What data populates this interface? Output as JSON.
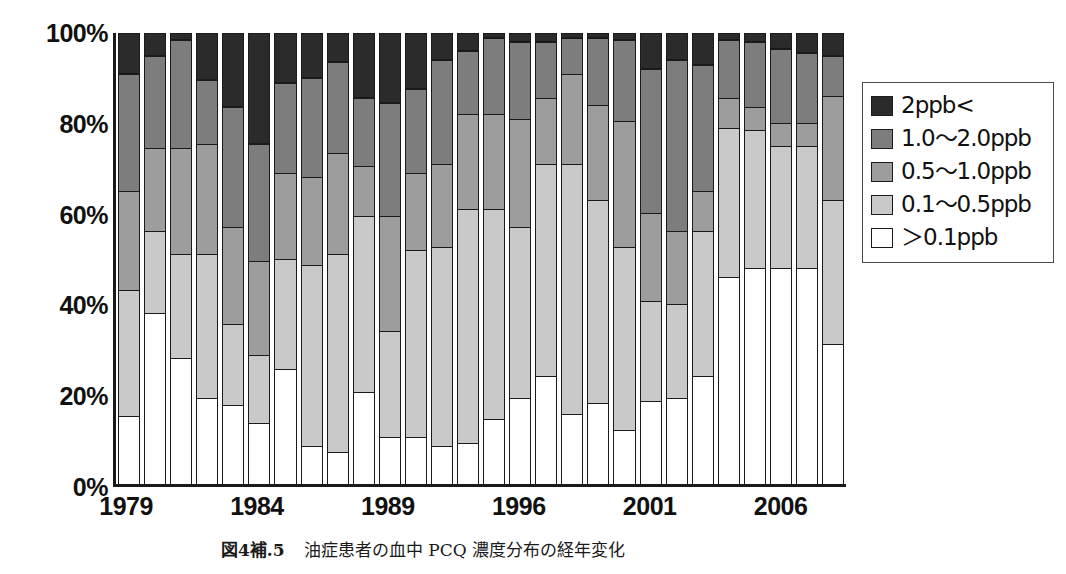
{
  "caption": {
    "figure_number": "図4補.5",
    "text": "油症患者の血中 PCQ 濃度分布の経年変化"
  },
  "legend": {
    "position": "right",
    "items": [
      {
        "label": "2ppb<",
        "color": "#2b2b2b",
        "key": "gt2"
      },
      {
        "label": "1.0〜2.0ppb",
        "color": "#7d7d7d",
        "key": "r1_2"
      },
      {
        "label": "0.5〜1.0ppb",
        "color": "#9d9d9d",
        "key": "r05_1"
      },
      {
        "label": "0.1〜0.5ppb",
        "color": "#c9c9c9",
        "key": "r01_05"
      },
      {
        "label": "＞0.1ppb",
        "color": "#ffffff",
        "key": "lt01"
      }
    ]
  },
  "chart_data": {
    "type": "bar",
    "stacked": true,
    "normalized_percent": true,
    "title": "",
    "xlabel": "",
    "ylabel": "",
    "ylim": [
      0,
      100
    ],
    "grid": false,
    "ytick_labels": [
      "0%",
      "20%",
      "40%",
      "60%",
      "80%",
      "100%"
    ],
    "ytick_values": [
      0,
      20,
      40,
      60,
      80,
      100
    ],
    "xtick_labels": [
      "1979",
      "1984",
      "1989",
      "1996",
      "2001",
      "2006"
    ],
    "xtick_bar_index": [
      0,
      5,
      10,
      15,
      20,
      25
    ],
    "categories": [
      "1979",
      "1980",
      "1981",
      "1982",
      "1983",
      "1984",
      "1985",
      "1986",
      "1987",
      "1988",
      "1989",
      "1990",
      "1991",
      "1992",
      "1993",
      "1996",
      "1997",
      "1998",
      "1999",
      "2000",
      "2001",
      "2002",
      "2003",
      "2004",
      "2005",
      "2006",
      "2007",
      "2008"
    ],
    "series": [
      {
        "name": "＞0.1ppb",
        "color": "#ffffff",
        "values": [
          15,
          38,
          28,
          19,
          17.5,
          13.5,
          25.5,
          8.5,
          7,
          20.5,
          10.5,
          10.5,
          8.5,
          9,
          14.5,
          19,
          24,
          15.5,
          18,
          12,
          18.5,
          19,
          24,
          46,
          48,
          48,
          48,
          31
        ]
      },
      {
        "name": "0.1〜0.5ppb",
        "color": "#c9c9c9",
        "values": [
          28,
          18,
          23,
          32,
          18,
          15,
          24.5,
          40,
          44,
          39,
          23.5,
          41.5,
          44,
          52,
          46.5,
          38,
          47,
          55.5,
          45,
          40.5,
          22,
          21,
          32,
          33,
          30.5,
          27,
          27,
          32
        ]
      },
      {
        "name": "0.5〜1.0ppb",
        "color": "#9d9d9d",
        "values": [
          22,
          18.5,
          23.5,
          24.5,
          21.5,
          21,
          19,
          19.5,
          22.5,
          11,
          25.5,
          17,
          18.5,
          21,
          21,
          24,
          14.5,
          20,
          21,
          28,
          19.5,
          16,
          9,
          6.5,
          5,
          5,
          5,
          23
        ]
      },
      {
        "name": "1.0〜2.0ppb",
        "color": "#7d7d7d",
        "values": [
          26,
          20.5,
          24,
          14,
          26.5,
          26,
          20,
          22,
          20,
          15,
          25,
          18.5,
          23,
          14,
          17,
          17,
          12.5,
          8,
          15,
          18,
          32,
          38,
          28,
          13,
          14.5,
          16.5,
          15.5,
          9
        ]
      },
      {
        "name": "2ppb<",
        "color": "#2b2b2b",
        "values": [
          9,
          5,
          1.5,
          10.5,
          16.5,
          24.5,
          11,
          10,
          6.5,
          14.5,
          15.5,
          12.5,
          6,
          4,
          1,
          2,
          2,
          1,
          1,
          1.5,
          8,
          6,
          7,
          1.5,
          2,
          3.5,
          4.5,
          5
        ]
      }
    ]
  }
}
